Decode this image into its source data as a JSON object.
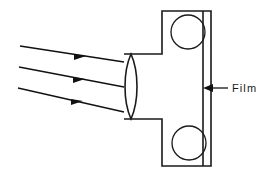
{
  "figure": {
    "background_color": "#ffffff",
    "line_color": "#1a1a1a"
  },
  "labels": {
    "film": "Film"
  },
  "annotations": {
    "film_pointer": {
      "name": "film-leader-arrow",
      "direction": "left",
      "target": "film-plane"
    }
  },
  "optics": {
    "lens": {
      "name": "biconvex-lens",
      "center_x": 131,
      "top_y": 54,
      "bottom_y": 119,
      "half_width": 8
    },
    "rays": [
      {
        "name": "light-ray-upper",
        "x1": 20,
        "y1": 46,
        "x2": 124,
        "y2": 62,
        "arrow_at": 0.62
      },
      {
        "name": "light-ray-middle",
        "x1": 19,
        "y1": 67,
        "x2": 124,
        "y2": 87,
        "arrow_at": 0.62
      },
      {
        "name": "light-ray-lower",
        "x1": 18,
        "y1": 88,
        "x2": 124,
        "y2": 112,
        "arrow_at": 0.62
      }
    ]
  },
  "body": {
    "name": "camera-body-outline",
    "neck_left_x": 124,
    "neck_top_y": 54,
    "neck_bottom_y": 119,
    "shoulder_x": 162,
    "body_top_y": 11,
    "body_bottom_y": 166,
    "film_plane_x": 203,
    "back_wall_x": 211
  },
  "spools": [
    {
      "name": "film-spool-top",
      "cx": 188,
      "cy": 32,
      "r": 17
    },
    {
      "name": "film-spool-bottom",
      "cx": 189,
      "cy": 143,
      "r": 17
    }
  ]
}
